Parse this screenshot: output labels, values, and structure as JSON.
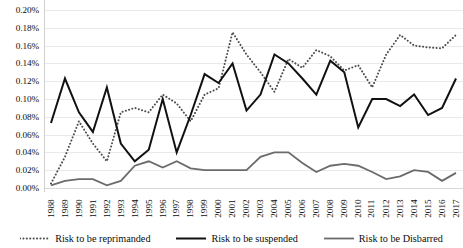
{
  "chart_data": {
    "type": "line",
    "title": "",
    "xlabel": "",
    "ylabel": "",
    "ylim": [
      0.0,
      0.2
    ],
    "ytick_step": 0.02,
    "ytick_labels": [
      "0.20%",
      "0.18%",
      "0.16%",
      "0.14%",
      "0.12%",
      "0.10%",
      "0.08%",
      "0.06%",
      "0.04%",
      "0.02%",
      "0.00%"
    ],
    "ytick_values": [
      0.2,
      0.18,
      0.16,
      0.14,
      0.12,
      0.1,
      0.08,
      0.06,
      0.04,
      0.02,
      0.0
    ],
    "grid": true,
    "legend_position": "bottom",
    "categories": [
      "1988",
      "1989",
      "1990",
      "1991",
      "1992",
      "1993",
      "1994",
      "1995",
      "1996",
      "1997",
      "1998",
      "1999",
      "2000",
      "2001",
      "2002",
      "2003",
      "2004",
      "2005",
      "2006",
      "2007",
      "2008",
      "2009",
      "2010",
      "2011",
      "2012",
      "2013",
      "2014",
      "2015",
      "2016",
      "2017"
    ],
    "series": [
      {
        "name": "Risk to be reprimanded",
        "style": "dotted",
        "color": "#4d4d4d",
        "values": [
          0.005,
          0.035,
          0.075,
          0.05,
          0.03,
          0.085,
          0.09,
          0.085,
          0.105,
          0.095,
          0.075,
          0.105,
          0.112,
          0.175,
          0.15,
          0.13,
          0.108,
          0.145,
          0.135,
          0.155,
          0.148,
          0.132,
          0.138,
          0.113,
          0.15,
          0.172,
          0.16,
          0.158,
          0.157,
          0.172
        ]
      },
      {
        "name": "Risk to be suspended",
        "style": "solid-thick",
        "color": "#111111",
        "values": [
          0.073,
          0.123,
          0.085,
          0.063,
          0.113,
          0.05,
          0.03,
          0.043,
          0.1,
          0.04,
          0.082,
          0.128,
          0.118,
          0.14,
          0.087,
          0.105,
          0.15,
          0.14,
          0.123,
          0.105,
          0.143,
          0.13,
          0.068,
          0.1,
          0.1,
          0.092,
          0.105,
          0.082,
          0.09,
          0.123
        ]
      },
      {
        "name": "Risk to be Disbarred",
        "style": "solid-thin",
        "color": "#6b6b6b",
        "values": [
          0.003,
          0.008,
          0.01,
          0.01,
          0.003,
          0.008,
          0.025,
          0.03,
          0.023,
          0.03,
          0.022,
          0.02,
          0.02,
          0.02,
          0.02,
          0.035,
          0.04,
          0.04,
          0.028,
          0.018,
          0.025,
          0.027,
          0.025,
          0.018,
          0.01,
          0.013,
          0.02,
          0.018,
          0.008,
          0.017
        ]
      }
    ]
  },
  "legend": {
    "items": [
      {
        "label": "Risk to be reprimanded"
      },
      {
        "label": "Risk to be suspended"
      },
      {
        "label": "Risk to be Disbarred"
      }
    ]
  }
}
